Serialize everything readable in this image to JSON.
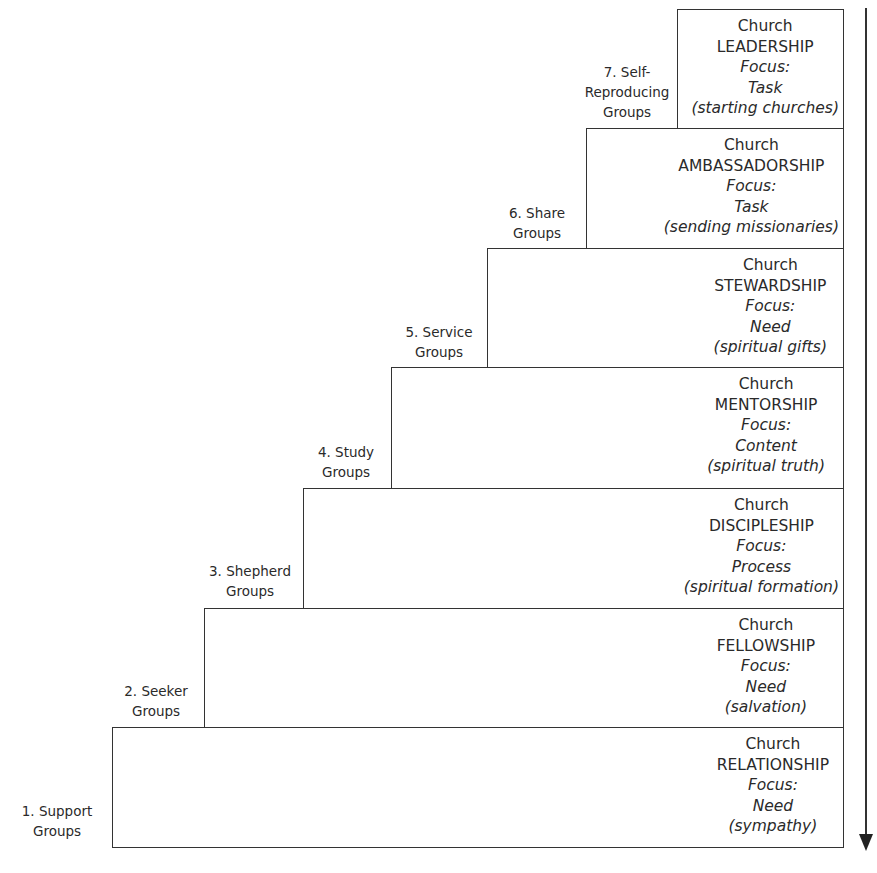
{
  "diagram": {
    "levels": [
      {
        "label_line1": "1. Support",
        "label_line2": "Groups",
        "church": "Church",
        "title": "RELATIONSHIP",
        "focus_label": "Focus:",
        "focus": "Need",
        "detail": "(sympathy)"
      },
      {
        "label_line1": "2. Seeker",
        "label_line2": "Groups",
        "church": "Church",
        "title": "FELLOWSHIP",
        "focus_label": "Focus:",
        "focus": "Need",
        "detail": "(salvation)"
      },
      {
        "label_line1": "3. Shepherd",
        "label_line2": "Groups",
        "church": "Church",
        "title": "DISCIPLESHIP",
        "focus_label": "Focus:",
        "focus": "Process",
        "detail": "(spiritual formation)"
      },
      {
        "label_line1": "4. Study",
        "label_line2": "Groups",
        "church": "Church",
        "title": "MENTORSHIP",
        "focus_label": "Focus:",
        "focus": "Content",
        "detail": "(spiritual truth)"
      },
      {
        "label_line1": "5. Service",
        "label_line2": "Groups",
        "church": "Church",
        "title": "STEWARDSHIP",
        "focus_label": "Focus:",
        "focus": "Need",
        "detail": "(spiritual gifts)"
      },
      {
        "label_line1": "6. Share",
        "label_line2": "Groups",
        "church": "Church",
        "title": "AMBASSADORSHIP",
        "focus_label": "Focus:",
        "focus": "Task",
        "detail": "(sending missionaries)"
      },
      {
        "label_line1": "7. Self-",
        "label_line1b": "Reproducing",
        "label_line2": "Groups",
        "church": "Church",
        "title": "LEADERSHIP",
        "focus_label": "Focus:",
        "focus": "Task",
        "detail": "(starting churches)"
      }
    ],
    "arrow": "down-arrow"
  }
}
